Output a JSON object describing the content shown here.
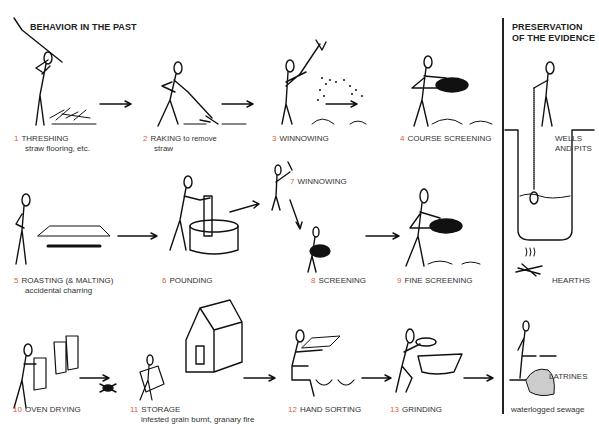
{
  "sections": {
    "left_title": "BEHAVIOR IN THE PAST",
    "right_title_line1": "PRESERVATION",
    "right_title_line2": "OF THE EVIDENCE"
  },
  "steps": [
    {
      "num": "1",
      "label": "THRESHING",
      "note": "straw flooring, etc."
    },
    {
      "num": "2",
      "label": "RAKING",
      "inline_note": "to remove",
      "note": "straw"
    },
    {
      "num": "3",
      "label": "WINNOWING",
      "note": ""
    },
    {
      "num": "4",
      "label": "COURSE SCREENING",
      "note": ""
    },
    {
      "num": "5",
      "label": "ROASTING (& MALTING)",
      "note": "accidental charring"
    },
    {
      "num": "6",
      "label": "POUNDING",
      "note": ""
    },
    {
      "num": "7",
      "label": "WINNOWING",
      "note": ""
    },
    {
      "num": "8",
      "label": "SCREENING",
      "note": ""
    },
    {
      "num": "9",
      "label": "FINE SCREENING",
      "note": ""
    },
    {
      "num": "10",
      "label": "OVEN DRYING",
      "note": ""
    },
    {
      "num": "11",
      "label": "STORAGE",
      "note": "infested grain burnt, granary fire"
    },
    {
      "num": "12",
      "label": "HAND SORTING",
      "note": ""
    },
    {
      "num": "13",
      "label": "GRINDING",
      "note": ""
    }
  ],
  "evidence": [
    {
      "label_line1": "WELLS",
      "label_line2": "AND PITS"
    },
    {
      "label_line1": "HEARTHS"
    },
    {
      "label_line1": "LATRINES",
      "note": "waterlogged sewage"
    }
  ],
  "colors": {
    "step_number": "#e0603a",
    "text": "#333333",
    "line": "#111111"
  }
}
